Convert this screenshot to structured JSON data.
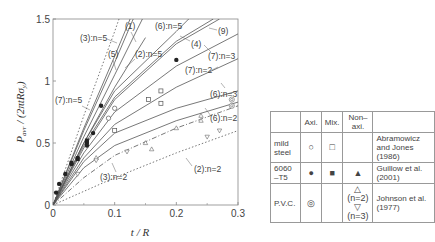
{
  "chart_data": {
    "type": "line",
    "title": "",
    "xlabel": "t / R",
    "ylabel": "P_avr / (2πtRσ_y)",
    "xlim": [
      0,
      0.3
    ],
    "ylim": [
      0,
      1.5
    ],
    "x_ticks": [
      "0",
      "0.1",
      "0.2",
      "0.3"
    ],
    "y_ticks": [
      "0",
      "0.5",
      "1",
      "1.5"
    ],
    "grid": false,
    "series": [
      {
        "name": "(1)",
        "style": "solid",
        "points": [
          [
            0,
            0
          ],
          [
            0.05,
            0.62
          ],
          [
            0.1,
            1.2
          ],
          [
            0.125,
            1.5
          ]
        ]
      },
      {
        "name": "(3):n=5",
        "style": "dotted",
        "points": [
          [
            0,
            0
          ],
          [
            0.05,
            0.72
          ],
          [
            0.1,
            1.4
          ],
          [
            0.107,
            1.5
          ]
        ]
      },
      {
        "name": "(5)",
        "style": "solid",
        "points": [
          [
            0,
            0
          ],
          [
            0.05,
            0.6
          ],
          [
            0.1,
            1.15
          ],
          [
            0.13,
            1.5
          ]
        ]
      },
      {
        "name": "(2):n=5",
        "style": "solid",
        "points": [
          [
            0,
            0
          ],
          [
            0.05,
            0.55
          ],
          [
            0.1,
            1.05
          ],
          [
            0.145,
            1.5
          ]
        ]
      },
      {
        "name": "(6):n=5",
        "style": "solid",
        "points": [
          [
            0,
            0
          ],
          [
            0.05,
            0.5
          ],
          [
            0.1,
            0.92
          ],
          [
            0.2,
            1.4
          ],
          [
            0.22,
            1.5
          ]
        ]
      },
      {
        "name": "(4)",
        "style": "solid",
        "points": [
          [
            0,
            0
          ],
          [
            0.05,
            0.48
          ],
          [
            0.1,
            0.87
          ],
          [
            0.2,
            1.32
          ],
          [
            0.26,
            1.5
          ]
        ]
      },
      {
        "name": "(9)",
        "style": "solid",
        "points": [
          [
            0,
            0
          ],
          [
            0.05,
            0.46
          ],
          [
            0.1,
            0.85
          ],
          [
            0.2,
            1.3
          ],
          [
            0.27,
            1.5
          ]
        ]
      },
      {
        "name": "(7):n=5",
        "style": "solid",
        "points": [
          [
            0,
            0
          ],
          [
            0.05,
            0.5
          ],
          [
            0.1,
            0.95
          ],
          [
            0.15,
            1.35
          ]
        ]
      },
      {
        "name": "(7):n=3",
        "style": "solid",
        "points": [
          [
            0,
            0
          ],
          [
            0.05,
            0.42
          ],
          [
            0.1,
            0.75
          ],
          [
            0.2,
            1.12
          ],
          [
            0.3,
            1.38
          ]
        ]
      },
      {
        "name": "(7):n=2",
        "style": "solid",
        "points": [
          [
            0,
            0
          ],
          [
            0.05,
            0.38
          ],
          [
            0.1,
            0.65
          ],
          [
            0.2,
            0.95
          ],
          [
            0.3,
            1.18
          ]
        ]
      },
      {
        "name": "(6):n=3",
        "style": "solid",
        "points": [
          [
            0,
            0
          ],
          [
            0.05,
            0.35
          ],
          [
            0.1,
            0.58
          ],
          [
            0.2,
            0.78
          ],
          [
            0.3,
            0.92
          ]
        ]
      },
      {
        "name": "(6):n=2",
        "style": "solid",
        "points": [
          [
            0,
            0
          ],
          [
            0.05,
            0.3
          ],
          [
            0.1,
            0.48
          ],
          [
            0.2,
            0.68
          ],
          [
            0.3,
            0.83
          ]
        ]
      },
      {
        "name": "(3):n=2",
        "style": "dashdot",
        "points": [
          [
            0,
            0
          ],
          [
            0.05,
            0.22
          ],
          [
            0.1,
            0.4
          ],
          [
            0.2,
            0.62
          ],
          [
            0.3,
            0.8
          ]
        ]
      },
      {
        "name": "(2):n=2",
        "style": "dotted",
        "points": [
          [
            0,
            0
          ],
          [
            0.1,
            0.22
          ],
          [
            0.2,
            0.42
          ],
          [
            0.3,
            0.6
          ]
        ]
      }
    ],
    "markers": [
      {
        "group": "mild steel Axi.",
        "symbol": "circle-open",
        "points": [
          [
            0.1,
            0.78
          ],
          [
            0.09,
            0.7
          ]
        ]
      },
      {
        "group": "mild steel Mix.",
        "symbol": "square-open",
        "points": [
          [
            0.1,
            0.6
          ],
          [
            0.175,
            0.92
          ],
          [
            0.175,
            0.82
          ],
          [
            0.155,
            0.85
          ]
        ]
      },
      {
        "group": "6060-T5 Axi.",
        "symbol": "circle-filled",
        "points": [
          [
            0.005,
            0.1
          ],
          [
            0.01,
            0.17
          ],
          [
            0.02,
            0.25
          ],
          [
            0.03,
            0.33
          ],
          [
            0.04,
            0.38
          ],
          [
            0.055,
            0.5
          ],
          [
            0.055,
            0.48
          ],
          [
            0.065,
            0.58
          ],
          [
            0.078,
            0.8
          ],
          [
            0.2,
            1.17
          ]
        ]
      },
      {
        "group": "6060-T5 Mix.",
        "symbol": "square-filled",
        "points": [
          [
            0.03,
            0.34
          ],
          [
            0.04,
            0.37
          ],
          [
            0.055,
            0.52
          ]
        ]
      },
      {
        "group": "P.V.C. Axi.",
        "symbol": "double-circle",
        "points": [
          [
            0.29,
            0.85
          ],
          [
            0.29,
            0.8
          ]
        ]
      },
      {
        "group": "P.V.C. Non-axi. n=2",
        "symbol": "triangle-up-open",
        "points": [
          [
            0.07,
            0.38
          ],
          [
            0.15,
            0.5
          ],
          [
            0.2,
            0.62
          ],
          [
            0.24,
            0.72
          ],
          [
            0.24,
            0.68
          ],
          [
            0.16,
            0.45
          ]
        ]
      },
      {
        "group": "P.V.C. Non-axi. n=3",
        "symbol": "triangle-down-open",
        "points": [
          [
            0.04,
            0.25
          ],
          [
            0.07,
            0.36
          ],
          [
            0.12,
            0.43
          ],
          [
            0.25,
            0.55
          ],
          [
            0.27,
            0.6
          ]
        ]
      }
    ],
    "legend_position": "right, outside plot"
  },
  "legend": {
    "headers": [
      "",
      "Axi.",
      "Mix.",
      "Non–axi.",
      ""
    ],
    "rows": [
      {
        "material": "mild steel",
        "axi": "○",
        "mix": "□",
        "nonaxi": "",
        "source": "Abramowicz and Jones (1986)"
      },
      {
        "material": "6060 –T5",
        "axi": "●",
        "mix": "■",
        "nonaxi": "▲",
        "source": "Guillow et al. (2001)"
      },
      {
        "material": "P.V.C.",
        "axi": "◎",
        "mix": "",
        "nonaxi": "△ (n=2)\n▽ (n=3)",
        "source": "Johnson et al. (1977)"
      }
    ],
    "nonaxi_pvc_1": "△ (n=2)",
    "nonaxi_pvc_2": "▽ (n=3)"
  }
}
